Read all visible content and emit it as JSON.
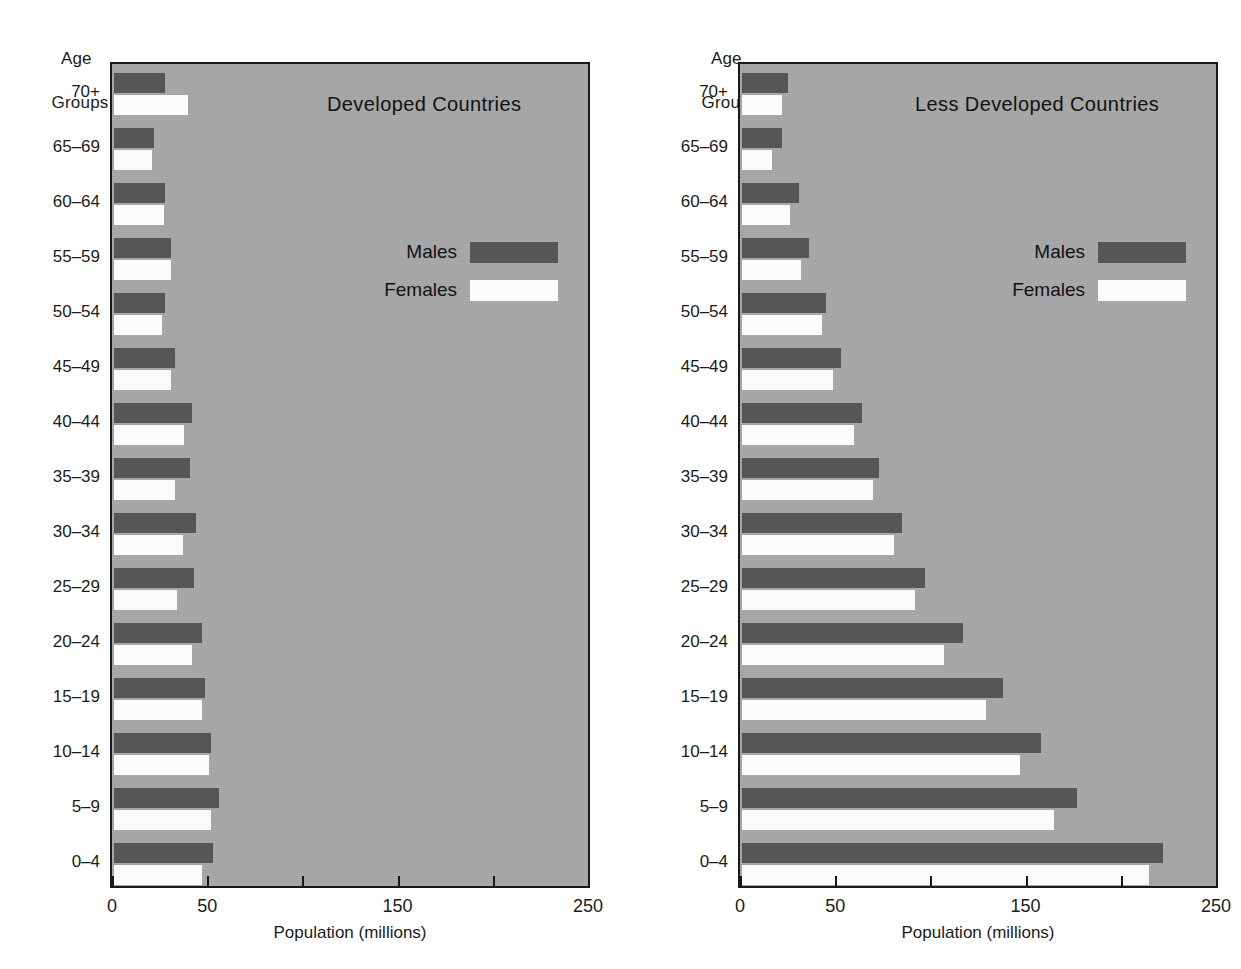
{
  "figure": {
    "axis_corner_label_line1": "Age",
    "axis_corner_label_line2": "Groups",
    "xaxis_title": "Population (millions)",
    "legend": {
      "males_label": "Males",
      "females_label": "Females",
      "male_color": "#565656",
      "female_color": "#fbfbfb"
    },
    "plot_background_color": "#a8a8a8",
    "axis_color": "#191919",
    "xticks_labeled": [
      "0",
      "50",
      "150",
      "250"
    ],
    "xticks_values": [
      0,
      50,
      100,
      150,
      200,
      250
    ],
    "xticks_values_labeled": [
      0,
      50,
      150,
      250
    ]
  },
  "chart_data": [
    {
      "type": "bar",
      "title": "Developed Countries",
      "xlabel": "Population (millions)",
      "ylabel": "Age Groups",
      "xlim": [
        0,
        250
      ],
      "grid": false,
      "legend_position": "upper-center-right",
      "orientation": "horizontal",
      "categories": [
        "70+",
        "65-69",
        "60-64",
        "55-59",
        "50-54",
        "45-49",
        "40-44",
        "35-39",
        "30-34",
        "25-29",
        "20-24",
        "15-19",
        "10-14",
        "5-9",
        "0-4"
      ],
      "series": [
        {
          "name": "Males",
          "values": [
            27,
            21,
            27,
            30,
            27,
            32,
            41,
            40,
            43,
            42,
            46,
            48,
            51,
            55,
            52
          ]
        },
        {
          "name": "Females",
          "values": [
            39,
            20,
            26,
            30,
            25,
            30,
            37,
            32,
            36,
            33,
            41,
            46,
            50,
            51,
            46
          ]
        }
      ]
    },
    {
      "type": "bar",
      "title": "Less Developed Countries",
      "xlabel": "Population (millions)",
      "ylabel": "Age Groups",
      "xlim": [
        0,
        250
      ],
      "grid": false,
      "legend_position": "upper-center-right",
      "orientation": "horizontal",
      "categories": [
        "70+",
        "65-69",
        "60-64",
        "55-59",
        "50-54",
        "45-49",
        "40-44",
        "35-39",
        "30-34",
        "25-29",
        "20-24",
        "15-19",
        "10-14",
        "5-9",
        "0-4"
      ],
      "series": [
        {
          "name": "Males",
          "values": [
            24,
            21,
            30,
            35,
            44,
            52,
            63,
            72,
            84,
            96,
            116,
            137,
            157,
            176,
            221
          ]
        },
        {
          "name": "Females",
          "values": [
            21,
            16,
            25,
            31,
            42,
            48,
            59,
            69,
            80,
            91,
            106,
            128,
            146,
            164,
            214
          ]
        }
      ]
    }
  ]
}
